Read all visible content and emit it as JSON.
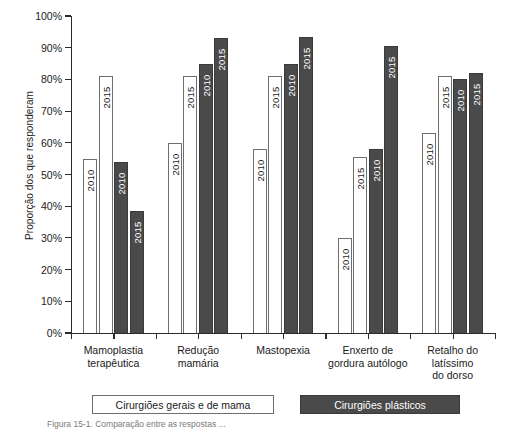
{
  "chart_data": {
    "type": "bar",
    "title": "",
    "xlabel": "",
    "ylabel": "Proporção dos que responderam",
    "ylim": [
      0,
      100
    ],
    "ytick_labels": [
      "0%",
      "10%",
      "20%",
      "30%",
      "40%",
      "50%",
      "60%",
      "70%",
      "80%",
      "90%",
      "100%"
    ],
    "ytick_values": [
      0,
      10,
      20,
      30,
      40,
      50,
      60,
      70,
      80,
      90,
      100
    ],
    "grid": false,
    "legend_position": "bottom",
    "categories": [
      "Mamoplastia terapêutica",
      "Redução mamária",
      "Mastopexia",
      "Enxerto de gordura autólogo",
      "Retalho do latíssimo do dorso"
    ],
    "series": [
      {
        "name": "Cirurgiões gerais e de mama",
        "year": "2010",
        "style": "light",
        "values": [
          55,
          60,
          58,
          30,
          63
        ]
      },
      {
        "name": "Cirurgiões gerais e de mama",
        "year": "2015",
        "style": "light",
        "values": [
          81,
          81,
          81,
          55.5,
          81
        ]
      },
      {
        "name": "Cirurgiões plásticos",
        "year": "2010",
        "style": "dark",
        "values": [
          54,
          85,
          85,
          58,
          80
        ]
      },
      {
        "name": "Cirurgiões plásticos",
        "year": "2015",
        "style": "dark",
        "values": [
          38.5,
          93,
          93.5,
          90.5,
          82
        ]
      }
    ],
    "groups": [
      {
        "category_lines": [
          "Mamoplastia",
          "terapêutica"
        ],
        "bars": [
          {
            "year": "2010",
            "style": "light",
            "value": 55
          },
          {
            "year": "2015",
            "style": "light",
            "value": 81
          },
          {
            "year": "2010",
            "style": "dark",
            "value": 54
          },
          {
            "year": "2015",
            "style": "dark",
            "value": 38.5
          }
        ]
      },
      {
        "category_lines": [
          "Redução",
          "mamária"
        ],
        "bars": [
          {
            "year": "2010",
            "style": "light",
            "value": 60
          },
          {
            "year": "2015",
            "style": "light",
            "value": 81
          },
          {
            "year": "2010",
            "style": "dark",
            "value": 85
          },
          {
            "year": "2015",
            "style": "dark",
            "value": 93
          }
        ]
      },
      {
        "category_lines": [
          "Mastopexia"
        ],
        "bars": [
          {
            "year": "2010",
            "style": "light",
            "value": 58
          },
          {
            "year": "2015",
            "style": "light",
            "value": 81
          },
          {
            "year": "2010",
            "style": "dark",
            "value": 85
          },
          {
            "year": "2015",
            "style": "dark",
            "value": 93.5
          }
        ]
      },
      {
        "category_lines": [
          "Enxerto de",
          "gordura autólogo"
        ],
        "bars": [
          {
            "year": "2010",
            "style": "light",
            "value": 30
          },
          {
            "year": "2015",
            "style": "light",
            "value": 55.5
          },
          {
            "year": "2010",
            "style": "dark",
            "value": 58
          },
          {
            "year": "2015",
            "style": "dark",
            "value": 90.5
          }
        ]
      },
      {
        "category_lines": [
          "Retalho do",
          "latíssimo",
          "do dorso"
        ],
        "bars": [
          {
            "year": "2010",
            "style": "light",
            "value": 63
          },
          {
            "year": "2015",
            "style": "light",
            "value": 81
          },
          {
            "year": "2010",
            "style": "dark",
            "value": 80
          },
          {
            "year": "2015",
            "style": "dark",
            "value": 82
          }
        ]
      }
    ],
    "legend": [
      {
        "label": "Cirurgiões gerais e de mama",
        "style": "light",
        "color": "#ffffff"
      },
      {
        "label": "Cirurgiões plásticos",
        "style": "dark",
        "color": "#4a4a4a"
      }
    ]
  },
  "axis": {
    "y_title": "Proporção dos que responderam"
  },
  "colors": {
    "light_fill": "#ffffff",
    "light_stroke": "#6e6e6e",
    "dark_fill": "#4a4a4a",
    "dark_stroke": "#3a3a3a",
    "axis": "#2b2b2b",
    "text": "#1a1a1a"
  },
  "caption": "Figura 15-1. Comparação entre as respostas ..."
}
